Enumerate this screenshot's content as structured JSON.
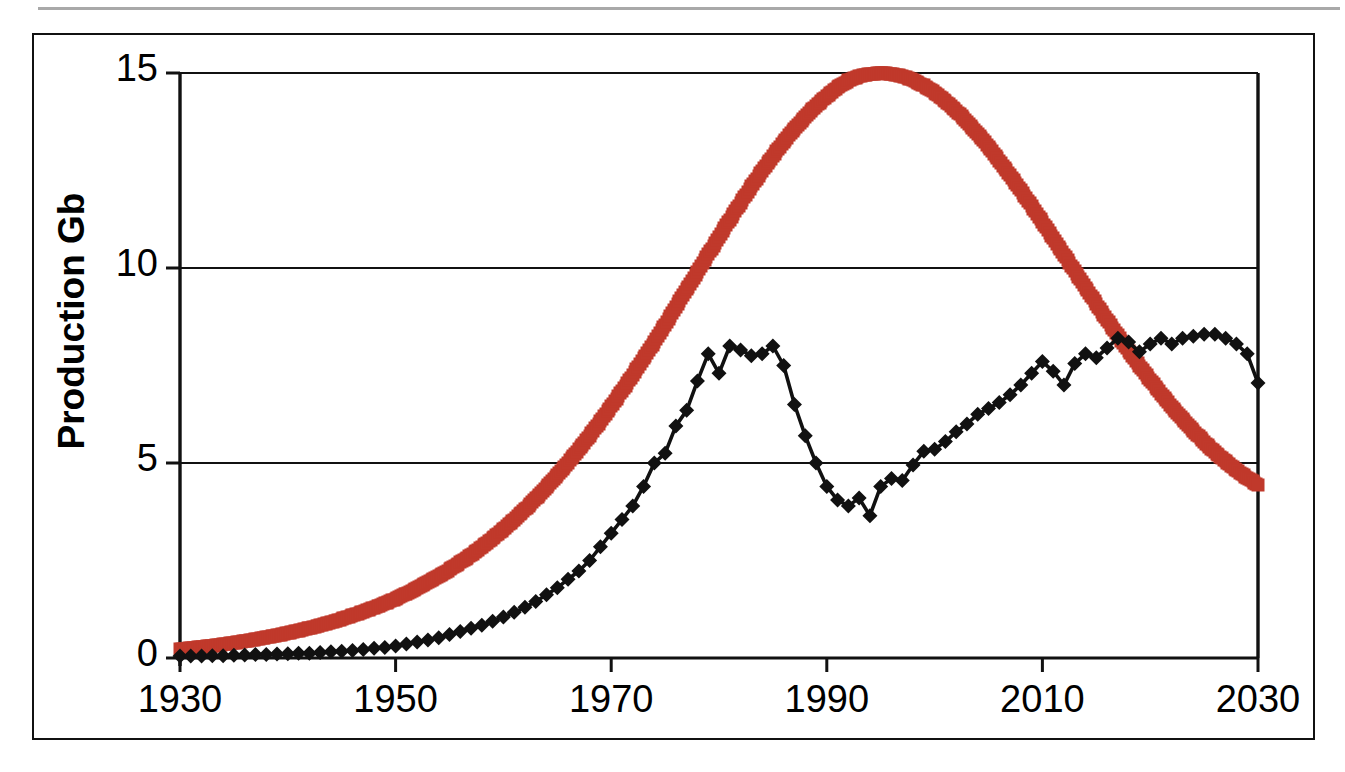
{
  "figure": {
    "background_color": "#ffffff",
    "frame_color": "#111111",
    "top_rule_color": "#9a9a9a"
  },
  "axis": {
    "y_title": "Production Gb",
    "y_ticks": [
      "0",
      "5",
      "10",
      "15"
    ],
    "x_ticks": [
      "1930",
      "1950",
      "1970",
      "1990",
      "2010",
      "2030"
    ]
  },
  "chart_data": {
    "type": "line",
    "title": "",
    "subtitle": "",
    "xlabel": "",
    "ylabel": "Production Gb",
    "xlim": [
      1930,
      2030
    ],
    "ylim": [
      0,
      15
    ],
    "x_ticks": [
      1930,
      1950,
      1970,
      1990,
      2010,
      2030
    ],
    "y_ticks": [
      0,
      5,
      10,
      15
    ],
    "grid": "horizontal",
    "legend": "none",
    "annotations": [],
    "series": [
      {
        "name": "Discovery-based model (smooth bell curve)",
        "color": "#C0392B",
        "marker": "square",
        "marker_size": 13,
        "line_style": "marker-chain",
        "x": [
          1930,
          1931,
          1932,
          1933,
          1934,
          1935,
          1936,
          1937,
          1938,
          1939,
          1940,
          1941,
          1942,
          1943,
          1944,
          1945,
          1946,
          1947,
          1948,
          1949,
          1950,
          1951,
          1952,
          1953,
          1954,
          1955,
          1956,
          1957,
          1958,
          1959,
          1960,
          1961,
          1962,
          1963,
          1964,
          1965,
          1966,
          1967,
          1968,
          1969,
          1970,
          1971,
          1972,
          1973,
          1974,
          1975,
          1976,
          1977,
          1978,
          1979,
          1980,
          1981,
          1982,
          1983,
          1984,
          1985,
          1986,
          1987,
          1988,
          1989,
          1990,
          1991,
          1992,
          1993,
          1994,
          1995,
          1996,
          1997,
          1998,
          1999,
          2000,
          2001,
          2002,
          2003,
          2004,
          2005,
          2006,
          2007,
          2008,
          2009,
          2010,
          2011,
          2012,
          2013,
          2014,
          2015,
          2016,
          2017,
          2018,
          2019,
          2020,
          2021,
          2022,
          2023,
          2024,
          2025,
          2026,
          2027,
          2028,
          2029,
          2030
        ],
        "y": [
          0.22,
          0.25,
          0.28,
          0.31,
          0.35,
          0.39,
          0.43,
          0.48,
          0.53,
          0.58,
          0.64,
          0.7,
          0.77,
          0.84,
          0.92,
          1.0,
          1.09,
          1.19,
          1.29,
          1.4,
          1.52,
          1.65,
          1.79,
          1.94,
          2.1,
          2.27,
          2.45,
          2.64,
          2.85,
          3.07,
          3.3,
          3.55,
          3.81,
          4.09,
          4.38,
          4.69,
          5.01,
          5.35,
          5.7,
          6.07,
          6.45,
          6.85,
          7.26,
          7.68,
          8.11,
          8.55,
          9.0,
          9.45,
          9.9,
          10.35,
          10.8,
          11.24,
          11.67,
          12.09,
          12.49,
          12.87,
          13.23,
          13.57,
          13.88,
          14.16,
          14.41,
          14.63,
          14.81,
          14.92,
          14.97,
          15.0,
          14.98,
          14.92,
          14.82,
          14.68,
          14.5,
          14.28,
          14.03,
          13.75,
          13.44,
          13.11,
          12.75,
          12.38,
          11.99,
          11.59,
          11.18,
          10.76,
          10.34,
          9.92,
          9.5,
          9.08,
          8.67,
          8.27,
          7.88,
          7.5,
          7.13,
          6.78,
          6.44,
          6.12,
          5.82,
          5.54,
          5.28,
          5.04,
          4.82,
          4.62,
          4.44
        ]
      },
      {
        "name": "Actual / historical production with diamonds",
        "color": "#111111",
        "marker": "diamond",
        "marker_size": 15,
        "line_style": "solid",
        "x": [
          1930,
          1931,
          1932,
          1933,
          1934,
          1935,
          1936,
          1937,
          1938,
          1939,
          1940,
          1941,
          1942,
          1943,
          1944,
          1945,
          1946,
          1947,
          1948,
          1949,
          1950,
          1951,
          1952,
          1953,
          1954,
          1955,
          1956,
          1957,
          1958,
          1959,
          1960,
          1961,
          1962,
          1963,
          1964,
          1965,
          1966,
          1967,
          1968,
          1969,
          1970,
          1971,
          1972,
          1973,
          1974,
          1975,
          1976,
          1977,
          1978,
          1979,
          1980,
          1981,
          1982,
          1983,
          1984,
          1985,
          1986,
          1987,
          1988,
          1989,
          1990,
          1991,
          1992,
          1993,
          1994,
          1995,
          1996,
          1997,
          1998,
          1999,
          2000,
          2001,
          2002,
          2003,
          2004,
          2005,
          2006,
          2007,
          2008,
          2009,
          2010,
          2011,
          2012,
          2013,
          2014,
          2015,
          2016,
          2017,
          2018,
          2019,
          2020,
          2021,
          2022,
          2023,
          2024,
          2025,
          2026,
          2027,
          2028,
          2029,
          2030
        ],
        "y": [
          0.05,
          0.05,
          0.05,
          0.06,
          0.06,
          0.07,
          0.08,
          0.09,
          0.09,
          0.1,
          0.11,
          0.12,
          0.12,
          0.14,
          0.16,
          0.17,
          0.19,
          0.22,
          0.25,
          0.27,
          0.31,
          0.36,
          0.41,
          0.46,
          0.52,
          0.6,
          0.68,
          0.76,
          0.84,
          0.94,
          1.05,
          1.17,
          1.3,
          1.45,
          1.62,
          1.8,
          2.02,
          2.23,
          2.5,
          2.85,
          3.2,
          3.55,
          3.9,
          4.4,
          5.0,
          5.25,
          5.95,
          6.35,
          7.1,
          7.8,
          7.3,
          8.0,
          7.9,
          7.75,
          7.8,
          8.0,
          7.5,
          6.5,
          5.7,
          5.0,
          4.4,
          4.05,
          3.9,
          4.1,
          3.65,
          4.4,
          4.6,
          4.55,
          4.95,
          5.3,
          5.35,
          5.55,
          5.8,
          6.0,
          6.25,
          6.4,
          6.55,
          6.75,
          7.0,
          7.3,
          7.6,
          7.35,
          7.0,
          7.55,
          7.8,
          7.7,
          7.95,
          8.2,
          8.1,
          7.85,
          8.05,
          8.2,
          8.05,
          8.2,
          8.25,
          8.3,
          8.3,
          8.2,
          8.05,
          7.8,
          7.05
        ]
      }
    ]
  }
}
